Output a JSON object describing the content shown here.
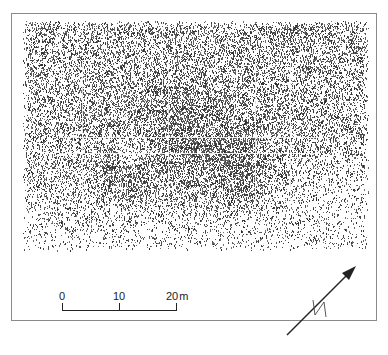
{
  "figure": {
    "type": "geophysical survey plot (stipple density)",
    "grid": {
      "vertical_lines_x": [
        82,
        168,
        255,
        290
      ],
      "horizontal_lines_y": [
        137,
        153
      ]
    }
  },
  "scale_bar": {
    "labels": [
      "0",
      "10",
      "20"
    ],
    "unit": "m",
    "length_m": 20
  },
  "north_arrow": {
    "label": "N",
    "bearing_deg": 40
  },
  "colors": {
    "ink": "#222222",
    "frame": "#8a8a8a",
    "background": "#ffffff"
  }
}
